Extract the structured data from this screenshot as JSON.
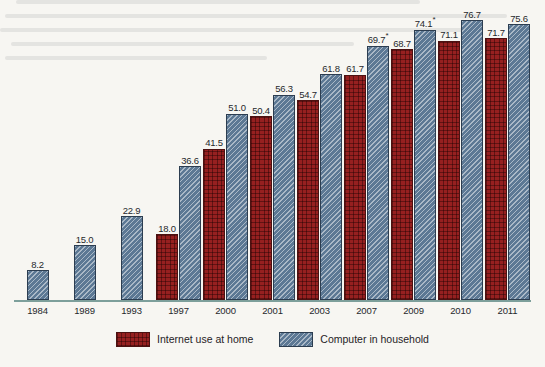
{
  "chart_data": {
    "type": "bar",
    "title": "",
    "subtitle": "",
    "xlabel": "",
    "ylabel": "",
    "ylim": [
      0,
      80
    ],
    "grid": false,
    "legend_position": "bottom-center",
    "categories": [
      "1984",
      "1989",
      "1993",
      "1997",
      "2000",
      "2001",
      "2003",
      "2007",
      "2009",
      "2010",
      "2011"
    ],
    "series": [
      {
        "name": "Internet use at home",
        "color": "#962020",
        "pattern": "crosshatch",
        "values": [
          null,
          null,
          null,
          18.0,
          41.5,
          50.4,
          54.7,
          61.7,
          68.7,
          71.1,
          71.7
        ],
        "labels": [
          "",
          "",
          "",
          "18.0",
          "41.5",
          "50.4",
          "54.7",
          "61.7",
          "68.7",
          "71.1",
          "71.7"
        ],
        "footnote_marks": [
          "",
          "",
          "",
          "",
          "",
          "",
          "",
          "",
          "",
          "",
          ""
        ]
      },
      {
        "name": "Computer in household",
        "color": "#5c7894",
        "pattern": "diagonal-hatch",
        "values": [
          8.2,
          15.0,
          22.9,
          36.6,
          51.0,
          56.3,
          61.8,
          69.7,
          74.1,
          76.7,
          75.6
        ],
        "labels": [
          "8.2",
          "15.0",
          "22.9",
          "36.6",
          "51.0",
          "56.3",
          "61.8",
          "69.7",
          "74.1",
          "76.7",
          "75.6"
        ],
        "footnote_marks": [
          "",
          "",
          "",
          "",
          "",
          "",
          "",
          "*",
          "*",
          "",
          ""
        ]
      }
    ]
  },
  "legend": {
    "entries": [
      {
        "label": "Internet use at home",
        "swatch": "red-crosshatch-swatch"
      },
      {
        "label": "Computer in household",
        "swatch": "blue-hatch-swatch"
      }
    ]
  },
  "axis": {
    "line_color": "#7d9f9b"
  }
}
